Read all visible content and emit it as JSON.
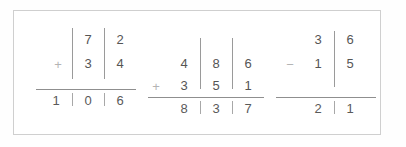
{
  "worksheet": {
    "title": "column-arithmetic-worksheet",
    "background_color": "#ffffff",
    "frame_color": "#cfcfcf",
    "digit_color": "#555555",
    "sign_color": "#b4b4b4",
    "rule_color": "#8f8f8f",
    "separator_color": "#9a9a9a"
  },
  "problems": [
    {
      "id": "problem-1",
      "operation": "addition",
      "operator_symbol": "+",
      "columns": 2,
      "addend_top": [
        "7",
        "2"
      ],
      "addend_bottom": [
        "3",
        "4"
      ],
      "result": [
        "1",
        "0",
        "6"
      ],
      "top_value": "72",
      "bottom_value": "34",
      "result_value": "106"
    },
    {
      "id": "problem-2",
      "operation": "addition",
      "operator_symbol": "+",
      "columns": 3,
      "addend_top": [
        "4",
        "8",
        "6"
      ],
      "addend_bottom": [
        "3",
        "5",
        "1"
      ],
      "result": [
        "8",
        "3",
        "7"
      ],
      "top_value": "486",
      "bottom_value": "351",
      "result_value": "837"
    },
    {
      "id": "problem-3",
      "operation": "subtraction",
      "operator_symbol": "−",
      "columns": 2,
      "minuend": [
        "3",
        "6"
      ],
      "subtrahend": [
        "1",
        "5"
      ],
      "result": [
        "2",
        "1"
      ],
      "top_value": "36",
      "bottom_value": "15",
      "result_value": "21"
    }
  ]
}
